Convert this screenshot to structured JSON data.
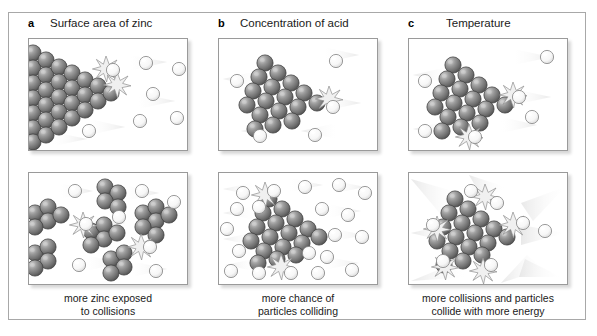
{
  "figure": {
    "type": "scientific-diagram",
    "background_color": "#ffffff",
    "frame_color": "#a8a8a8"
  },
  "legend_colors": {
    "zinc_particle": "#6f6f6f",
    "zinc_particle_highlight": "#c9c9c9",
    "zinc_particle_outline": "#3d3d3d",
    "acid_particle": "#fbfbfb",
    "acid_particle_outline": "#8c8c8c",
    "collision_burst": "#efefef",
    "motion_trail": "#e2e2e2",
    "panel_border": "#9a9a9a"
  },
  "columns": [
    {
      "letter": "a",
      "title": "Surface area of zinc",
      "caption_line1": "more zinc exposed",
      "caption_line2": "to collisions",
      "top_panel": {
        "name": "large-zinc-block-few-collisions",
        "zinc_arrangement": "single large solid block flush to left edge",
        "zinc_particle_count": 30,
        "acid_particle_count": 7,
        "collision_burst_count": 2
      },
      "bottom_panel": {
        "name": "powdered-zinc-many-collisions",
        "zinc_arrangement": "six small separated clusters (powder)",
        "zinc_particle_count": 30,
        "acid_particle_count": 7,
        "collision_burst_count": 2
      }
    },
    {
      "letter": "b",
      "title": "Concentration of acid",
      "caption_line1": "more chance of",
      "caption_line2": "particles colliding",
      "top_panel": {
        "name": "dilute-acid-few-particles",
        "zinc_arrangement": "single triangular cluster centred",
        "zinc_particle_count": 18,
        "acid_particle_count": 5,
        "collision_burst_count": 1
      },
      "bottom_panel": {
        "name": "concentrated-acid-many-particles",
        "zinc_arrangement": "single triangular cluster centred",
        "zinc_particle_count": 18,
        "acid_particle_count": 18,
        "collision_burst_count": 2
      }
    },
    {
      "letter": "c",
      "title": "Temperature",
      "caption_line1": "more collisions and particles",
      "caption_line2": "collide with more energy",
      "top_panel": {
        "name": "low-temperature-slow-particles",
        "zinc_arrangement": "single triangular cluster centred",
        "zinc_particle_count": 18,
        "acid_particle_count": 6,
        "collision_burst_count": 2
      },
      "bottom_panel": {
        "name": "high-temperature-fast-particles",
        "zinc_arrangement": "single triangular cluster centred",
        "zinc_particle_count": 18,
        "acid_particle_count": 7,
        "collision_burst_count": 4
      }
    }
  ]
}
